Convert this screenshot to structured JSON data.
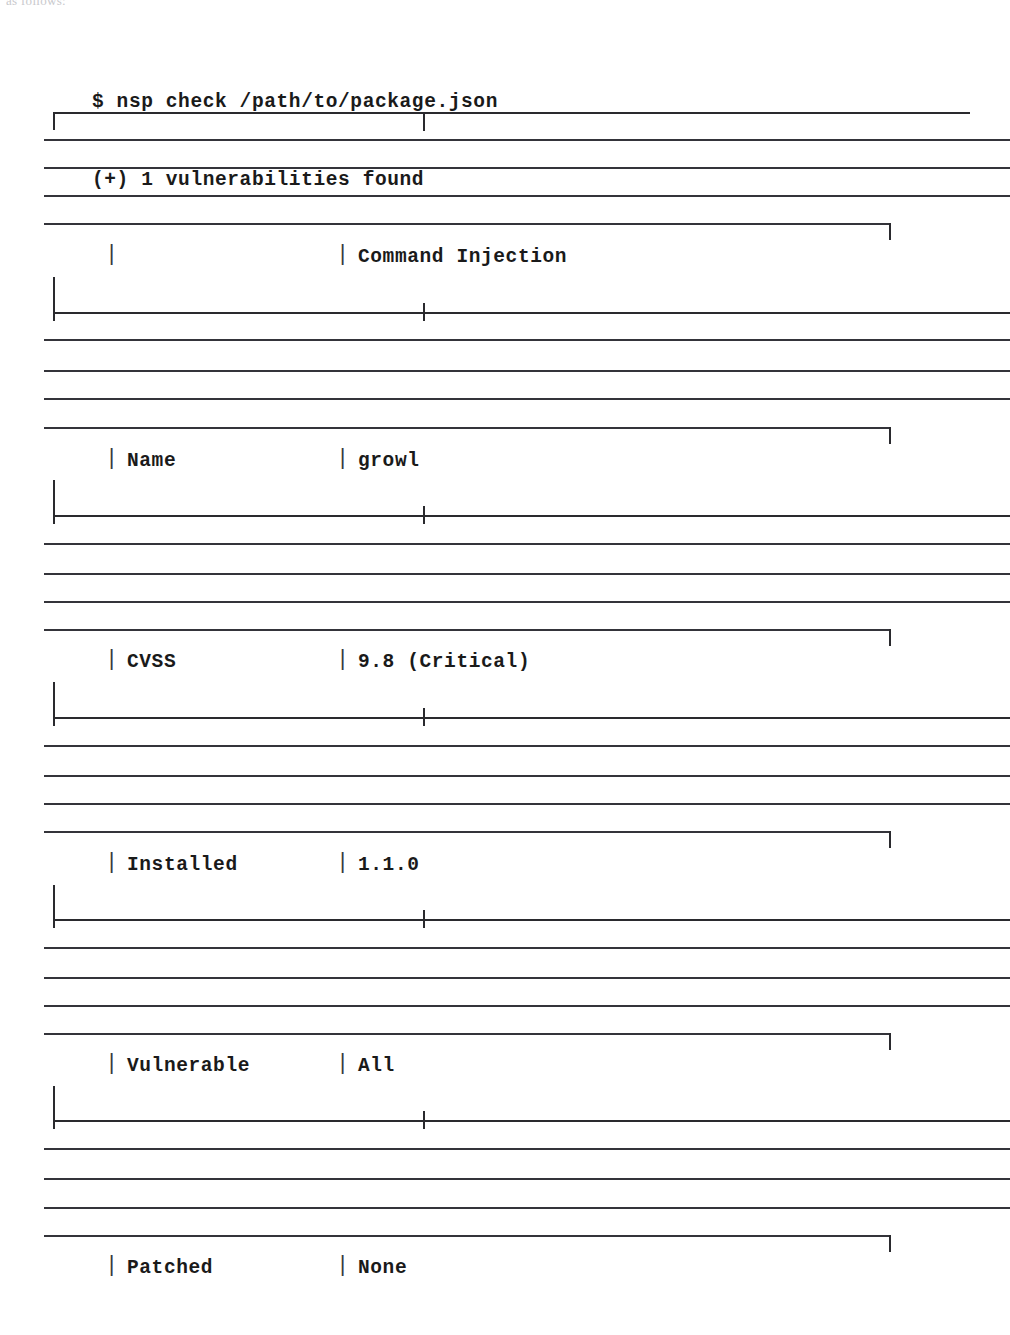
{
  "page": {
    "fragment_text": "as follows:",
    "background_color": "#ffffff",
    "ink_color": "#1a1a1a"
  },
  "terminal": {
    "prompt_line": "$ nsp check /path/to/package.json",
    "result_line": "(+) 1 vulnerabilities found",
    "command": "nsp check",
    "argument": "/path/to/package.json",
    "vulnerability_count": "1",
    "status_marker": "(+)"
  },
  "table": {
    "column_divider_glyph": "|",
    "rows": [
      {
        "label": "",
        "value": "Command Injection"
      },
      {
        "label": "Name",
        "value": "growl"
      },
      {
        "label": "CVSS",
        "value": "9.8 (Critical)"
      },
      {
        "label": "Installed",
        "value": "1.1.0"
      },
      {
        "label": "Vulnerable",
        "value": "All"
      },
      {
        "label": "Patched",
        "value": "None"
      }
    ]
  },
  "vulnerability": {
    "title": "Command Injection",
    "name": "growl",
    "cvss": "9.8 (Critical)",
    "severity": "Critical",
    "cvss_score": "9.8",
    "installed": "1.1.0",
    "vulnerable": "All",
    "patched": "None"
  }
}
